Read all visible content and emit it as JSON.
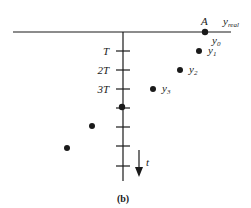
{
  "diagram": {
    "caption": "(b)",
    "horizontal_axis_label_main": "y",
    "horizontal_axis_label_sub": "real",
    "point_A_label": "A",
    "time_axis_label": "t",
    "tick_labels": [
      "T",
      "2T",
      "3T"
    ],
    "sample_labels": [
      {
        "main": "y",
        "sub": "0"
      },
      {
        "main": "y",
        "sub": "1"
      },
      {
        "main": "y",
        "sub": "2"
      },
      {
        "main": "y",
        "sub": "3"
      }
    ],
    "colors": {
      "ink": "#1a1a1a",
      "background": "#ffffff"
    }
  }
}
